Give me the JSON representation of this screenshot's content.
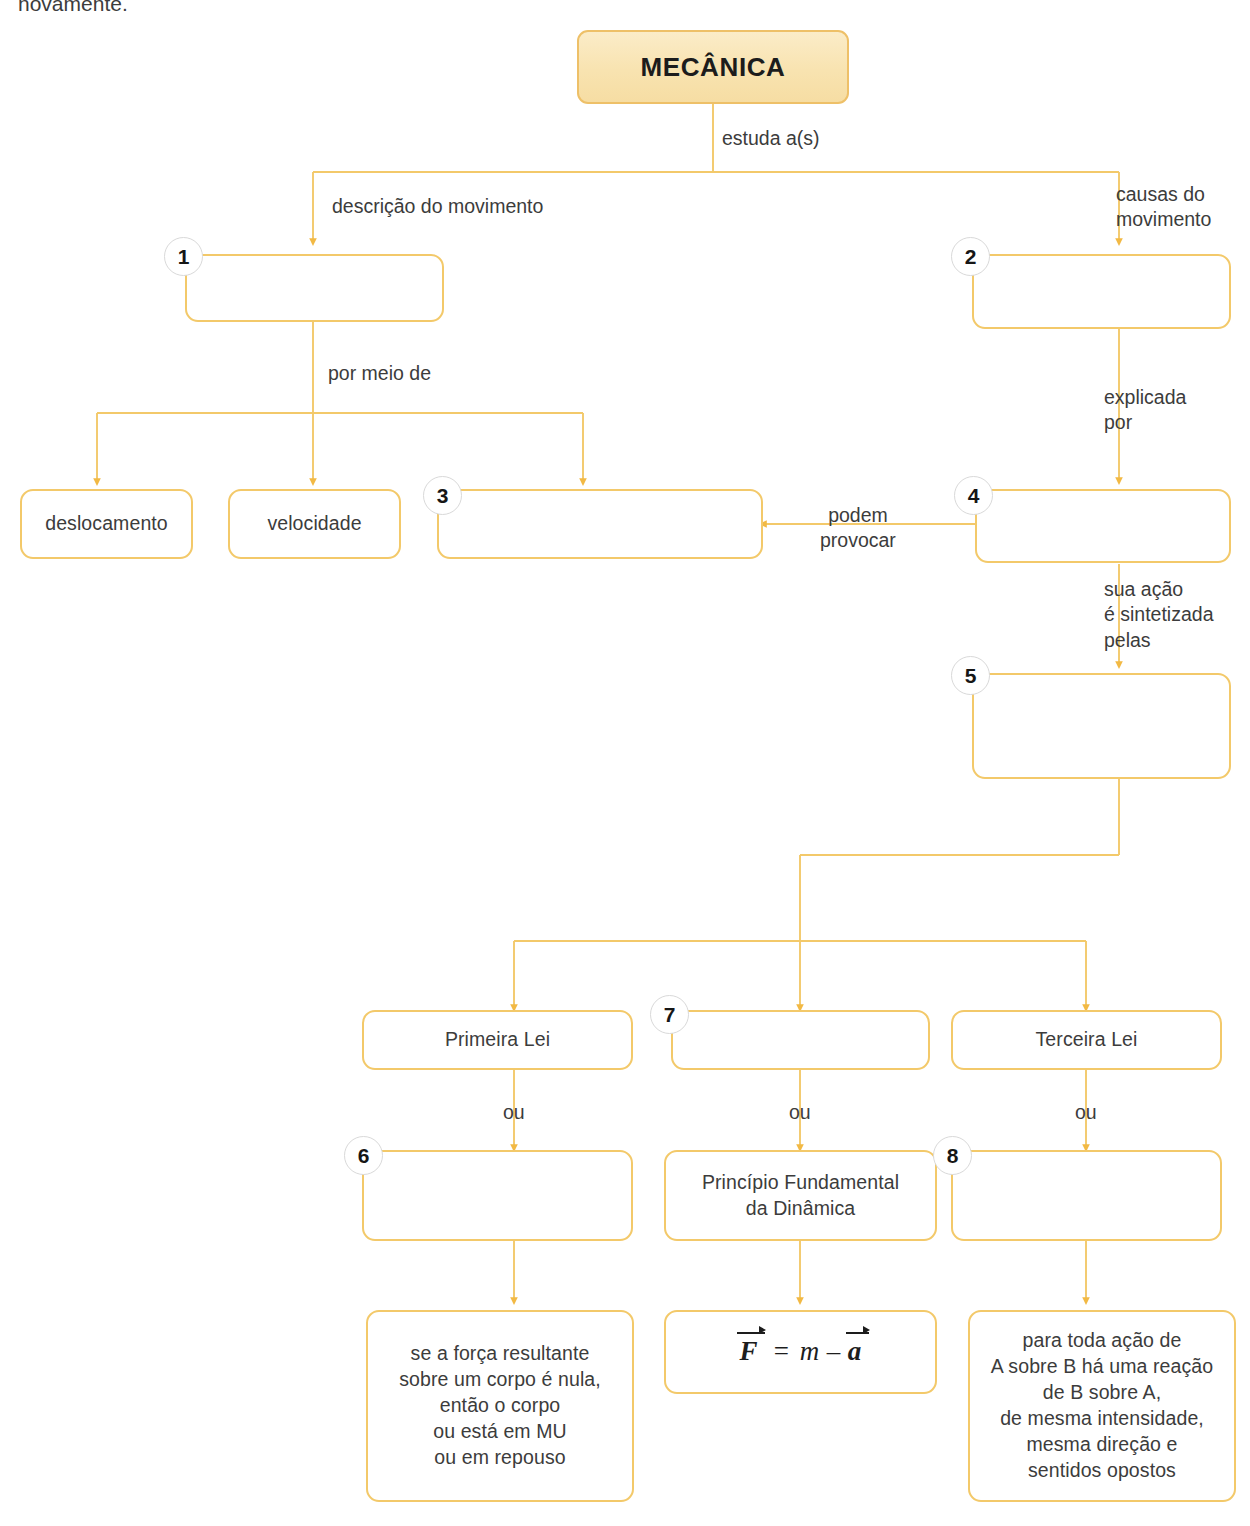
{
  "page": {
    "cut_text_top": "novamente.",
    "accent_border": "#f3c96a",
    "accent_fill": "#f8e3b0",
    "text_color": "#3c3c3c"
  },
  "nodes": {
    "mecanica": {
      "label": "MECÂNICA"
    },
    "box1": {
      "badge": "1",
      "label": ""
    },
    "box2": {
      "badge": "2",
      "label": ""
    },
    "deslocamento": {
      "label": "deslocamento"
    },
    "velocidade": {
      "label": "velocidade"
    },
    "box3": {
      "badge": "3",
      "label": ""
    },
    "box4": {
      "badge": "4",
      "label": ""
    },
    "box5": {
      "badge": "5",
      "label": ""
    },
    "primeira_lei": {
      "label": "Primeira Lei"
    },
    "box7": {
      "badge": "7",
      "label": ""
    },
    "terceira_lei": {
      "label": "Terceira Lei"
    },
    "box6": {
      "badge": "6",
      "label": ""
    },
    "principio": {
      "label": "Princípio Fundamental\nda Dinâmica"
    },
    "box8": {
      "badge": "8",
      "label": ""
    },
    "primeira_enunciado": {
      "label": "se a força resultante\nsobre um corpo é nula,\nentão o corpo\nou está em MU\nou em repouso"
    },
    "formula": {
      "f": "F",
      "eq": "=",
      "m": "m",
      "minus": "–",
      "a": "a"
    },
    "terceira_enunciado": {
      "label": "para toda ação de\nA sobre B há uma reação\nde B sobre A,\nde mesma intensidade,\nmesma direção e\nsentidos opostos"
    }
  },
  "edge_labels": {
    "estuda": "estuda a(s)",
    "descricao": "descrição do movimento",
    "causas": "causas do\nmovimento",
    "por_meio_de": "por meio de",
    "explicada_por": "explicada\npor",
    "podem_provocar": "podem\nprovocar",
    "sua_acao": "sua ação\né sintetizada\npelas",
    "ou_left": "ou",
    "ou_mid": "ou",
    "ou_right": "ou"
  }
}
